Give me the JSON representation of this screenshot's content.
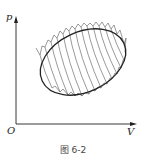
{
  "figure": {
    "caption": "图 6-2",
    "axes": {
      "y_label": "p",
      "x_label": "V",
      "origin_label": "O"
    },
    "colors": {
      "ink": "#222222",
      "hatch": "#555555",
      "background": "#ffffff"
    }
  }
}
